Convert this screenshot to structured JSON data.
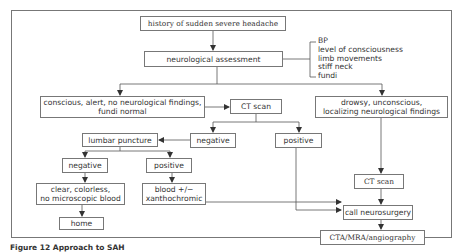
{
  "diagram": {
    "type": "flowchart",
    "nodes": {
      "start": "history of sudden severe headache",
      "assessment": "neurological assessment",
      "assessment_items": [
        "BP",
        "level of consciousness",
        "limb movements",
        "stiff neck",
        "fundi"
      ],
      "conscious_line1": "conscious, alert, no neurological findings,",
      "conscious_line2": "fundi normal",
      "ct_scan_mid": "CT scan",
      "drowsy_line1": "drowsy, unconscious,",
      "drowsy_line2": "localizing neurological findings",
      "lumbar_puncture": "lumbar puncture",
      "ct_negative": "negative",
      "ct_positive": "positive",
      "lp_negative": "negative",
      "lp_positive": "positive",
      "clear_line1": "clear, colorless,",
      "clear_line2": "no microscopic blood",
      "blood_line1": "blood +/−",
      "blood_line2": "xanthochromic",
      "home": "home",
      "ct_scan_right": "CT scan",
      "call_neurosurgery": "call neurosurgery",
      "angiography": "CTA/MRA/angiography"
    },
    "edges": [
      [
        "start",
        "assessment"
      ],
      [
        "assessment",
        "conscious"
      ],
      [
        "assessment",
        "drowsy"
      ],
      [
        "conscious",
        "ct_scan_mid"
      ],
      [
        "ct_scan_mid",
        "ct_negative"
      ],
      [
        "ct_scan_mid",
        "ct_positive"
      ],
      [
        "ct_negative",
        "lumbar_puncture"
      ],
      [
        "lumbar_puncture",
        "lp_negative"
      ],
      [
        "lumbar_puncture",
        "lp_positive"
      ],
      [
        "lp_negative",
        "clear"
      ],
      [
        "lp_positive",
        "blood"
      ],
      [
        "clear",
        "home"
      ],
      [
        "drowsy",
        "ct_scan_right"
      ],
      [
        "ct_scan_right",
        "call_neurosurgery"
      ],
      [
        "blood",
        "call_neurosurgery"
      ],
      [
        "ct_positive",
        "call_neurosurgery"
      ],
      [
        "call_neurosurgery",
        "angiography"
      ]
    ]
  },
  "caption": "Figure 12 Approach to SAH"
}
